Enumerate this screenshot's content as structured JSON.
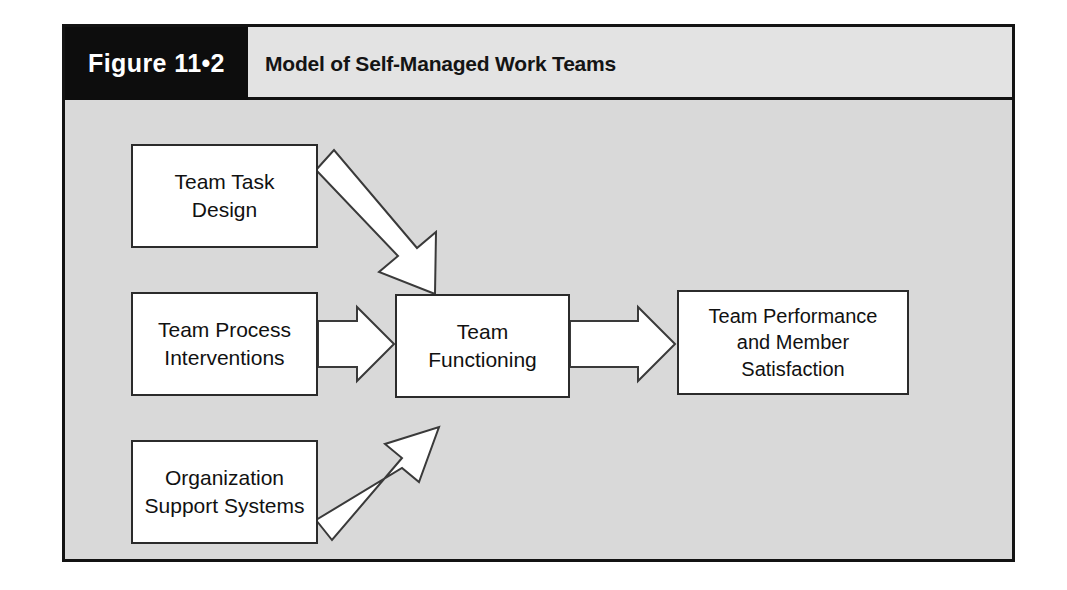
{
  "figure": {
    "tab_label": "Figure 11•2",
    "title": "Model of Self-Managed Work Teams",
    "frame_color": "#131313",
    "tab_background": "#0d0d0d",
    "header_background": "#e3e3e3",
    "body_background": "#d9d9d9",
    "box_fill": "#ffffff",
    "box_border": "#2b2b2b",
    "arrow_fill": "#ffffff",
    "arrow_stroke": "#3a3a3a"
  },
  "diagram": {
    "type": "flowchart",
    "nodes": [
      {
        "id": "team-task-design",
        "label": "Team Task\nDesign"
      },
      {
        "id": "team-process",
        "label": "Team Process\nInterventions"
      },
      {
        "id": "org-support",
        "label": "Organization\nSupport Systems"
      },
      {
        "id": "team-functioning",
        "label": "Team\nFunctioning"
      },
      {
        "id": "team-performance",
        "label": "Team Performance\nand Member\nSatisfaction"
      }
    ],
    "edges": [
      {
        "id": "edge-task-to-functioning",
        "from": "team-task-design",
        "to": "team-functioning",
        "style": "block-arrow-diagonal-down"
      },
      {
        "id": "edge-process-to-functioning",
        "from": "team-process",
        "to": "team-functioning",
        "style": "block-arrow-horizontal"
      },
      {
        "id": "edge-support-to-functioning",
        "from": "org-support",
        "to": "team-functioning",
        "style": "block-arrow-diagonal-up"
      },
      {
        "id": "edge-functioning-to-performance",
        "from": "team-functioning",
        "to": "team-performance",
        "style": "block-arrow-horizontal"
      }
    ]
  }
}
